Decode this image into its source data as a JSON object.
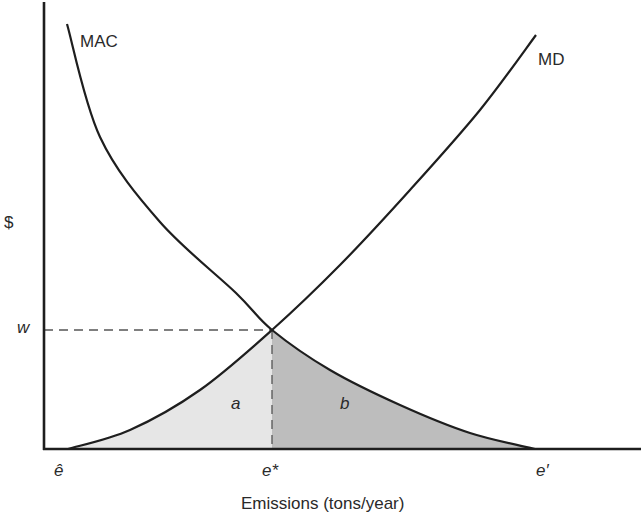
{
  "chart_data": {
    "type": "line",
    "title": "",
    "xlabel": "Emissions (tons/year)",
    "ylabel": "$",
    "grid": false,
    "legend": "none (curves labeled inline)",
    "x_ticks": [
      {
        "label": "ê",
        "pos": 68
      },
      {
        "label": "e*",
        "pos": 272
      },
      {
        "label": "e′",
        "pos": 535
      }
    ],
    "y_ticks": [
      {
        "label": "w",
        "pos": 330
      }
    ],
    "series": [
      {
        "name": "MAC",
        "description": "Marginal abatement cost, downward sloping convex",
        "points_px": [
          [
            67,
            24
          ],
          [
            100,
            137
          ],
          [
            160,
            222
          ],
          [
            236,
            293
          ],
          [
            272,
            330
          ],
          [
            330,
            370
          ],
          [
            400,
            405
          ],
          [
            470,
            433
          ],
          [
            535,
            449
          ]
        ]
      },
      {
        "name": "MD",
        "description": "Marginal damages, upward sloping convex",
        "points_px": [
          [
            68,
            449
          ],
          [
            130,
            430
          ],
          [
            200,
            390
          ],
          [
            272,
            330
          ],
          [
            340,
            265
          ],
          [
            410,
            190
          ],
          [
            480,
            110
          ],
          [
            536,
            35
          ]
        ]
      }
    ],
    "regions": [
      {
        "label": "a",
        "description": "area under MD from ê to e*",
        "fill": "#e6e6e6"
      },
      {
        "label": "b",
        "description": "area under MAC from e* to e′",
        "fill": "#bdbdbd"
      }
    ],
    "annotations": {
      "equilibrium": {
        "x_label": "e*",
        "y_label": "w",
        "px": [
          272,
          330
        ]
      },
      "dashed_lines": [
        "horizontal from y-axis to (e*, w)",
        "vertical from (e*, w) to x-axis"
      ]
    }
  },
  "labels": {
    "mac": "MAC",
    "md": "MD",
    "y_axis": "$",
    "w": "w",
    "a": "a",
    "b": "b",
    "e_hat": "ê",
    "e_star": "e*",
    "e_prime": "e′",
    "x_axis": "Emissions (tons/year)"
  },
  "colors": {
    "line": "#1e1e1e",
    "region_a": "#e6e6e6",
    "region_b": "#bdbdbd",
    "dash": "#555555"
  }
}
